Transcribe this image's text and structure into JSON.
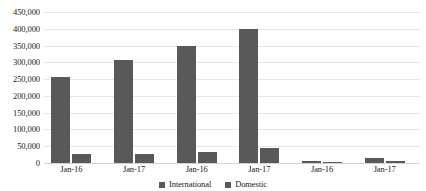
{
  "chart_data": {
    "type": "bar",
    "title": "",
    "xlabel": "",
    "ylabel": "",
    "ylim": [
      0,
      450000
    ],
    "grid": true,
    "legend_position": "bottom",
    "categories": [
      "Jan-16",
      "Jan-17",
      "Jan-16",
      "Jan-17",
      "Jan-16",
      "Jan-17"
    ],
    "y_ticks": [
      "450,000",
      "400,000",
      "350,000",
      "300,000",
      "250,000",
      "200,000",
      "150,000",
      "100,000",
      "50,000",
      "0"
    ],
    "y_tick_values": [
      450000,
      400000,
      350000,
      300000,
      250000,
      200000,
      150000,
      100000,
      50000,
      0
    ],
    "series": [
      {
        "name": "International",
        "color": "#595959",
        "values": [
          255000,
          308000,
          350000,
          400000,
          6000,
          15000
        ]
      },
      {
        "name": "Domestic",
        "color": "#595959",
        "values": [
          28000,
          26000,
          34000,
          45000,
          4000,
          5000
        ]
      }
    ]
  },
  "legend": {
    "items": [
      {
        "label": "International",
        "color": "#595959"
      },
      {
        "label": "Domestic",
        "color": "#595959"
      }
    ]
  }
}
